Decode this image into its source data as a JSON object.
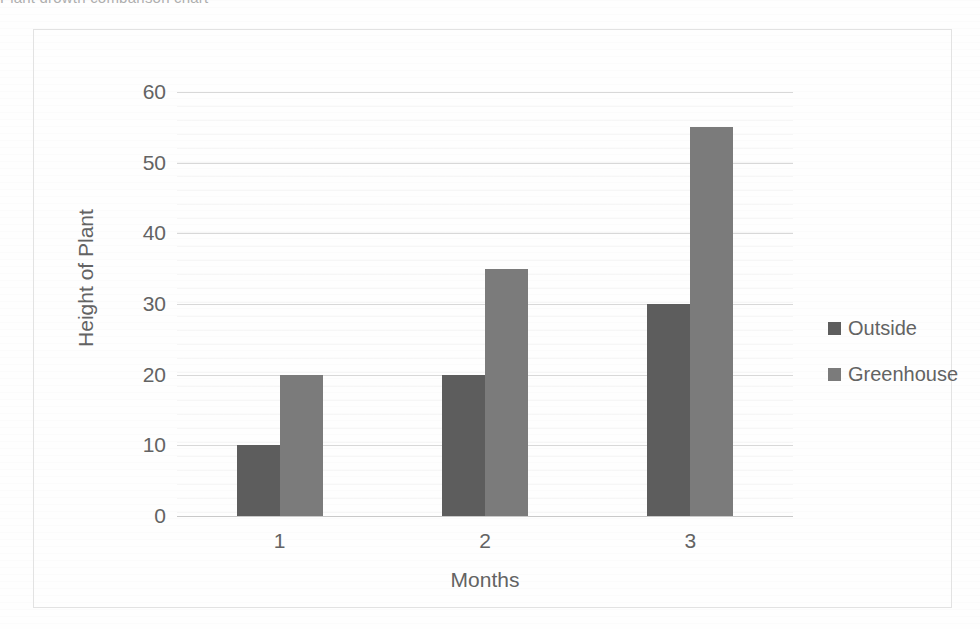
{
  "page": {
    "clipped_header_text": "Plant growth comparison chart"
  },
  "chart_data": {
    "type": "bar",
    "title": "",
    "subtitle": "",
    "xlabel": "Months",
    "ylabel": "Height of Plant",
    "categories": [
      "1",
      "2",
      "3"
    ],
    "series": [
      {
        "name": "Outside",
        "values": [
          10,
          20,
          30
        ],
        "color": "#5d5d5d"
      },
      {
        "name": "Greenhouse",
        "values": [
          20,
          35,
          55
        ],
        "color": "#7b7b7b"
      }
    ],
    "ylim": [
      0,
      60
    ],
    "ytick_values": [
      0,
      10,
      20,
      30,
      40,
      50,
      60
    ],
    "ytick_labels": [
      "0",
      "10",
      "20",
      "30",
      "40",
      "50",
      "60"
    ],
    "grid": true,
    "minor_grid": true,
    "legend_position": "right",
    "bar_group_layout": "clustered"
  },
  "legend": {
    "items": [
      {
        "label": "Outside",
        "color": "#5d5d5d"
      },
      {
        "label": "Greenhouse",
        "color": "#7b7b7b"
      }
    ]
  },
  "colors": {
    "series_outside": "#5d5d5d",
    "series_greenhouse": "#7b7b7b",
    "gridline": "#d8d8d8",
    "frame_border": "#e2e2e2",
    "text": "#636363",
    "background": "#fefefe"
  }
}
